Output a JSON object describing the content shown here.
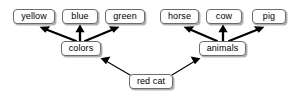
{
  "diagram": {
    "type": "graph",
    "title": "",
    "background_color": "#ffffff",
    "node_fill_color": "#ffffff",
    "node_border_color": "#6b6b6b",
    "node_text_color": "#000000",
    "edge_color": "#000000",
    "shadow_color": "#000000",
    "nodes": [
      {
        "id": "yellow",
        "label": "yellow",
        "x": 13,
        "y": 9,
        "w": 42,
        "h": 15
      },
      {
        "id": "blue",
        "label": "blue",
        "x": 62,
        "y": 9,
        "w": 36,
        "h": 15
      },
      {
        "id": "green",
        "label": "green",
        "x": 105,
        "y": 9,
        "w": 40,
        "h": 15
      },
      {
        "id": "horse",
        "label": "horse",
        "x": 160,
        "y": 9,
        "w": 39,
        "h": 15
      },
      {
        "id": "cow",
        "label": "cow",
        "x": 206,
        "y": 9,
        "w": 36,
        "h": 15
      },
      {
        "id": "pig",
        "label": "pig",
        "x": 252,
        "y": 9,
        "w": 34,
        "h": 15
      },
      {
        "id": "colors",
        "label": "colors",
        "x": 61,
        "y": 41,
        "w": 40,
        "h": 15
      },
      {
        "id": "animals",
        "label": "animals",
        "x": 199,
        "y": 41,
        "w": 47,
        "h": 15
      },
      {
        "id": "redcat",
        "label": "red cat",
        "x": 129,
        "y": 74,
        "w": 44,
        "h": 15
      }
    ],
    "edges": [
      {
        "from": "colors",
        "to": "yellow",
        "style": "thick",
        "arrow": "end"
      },
      {
        "from": "colors",
        "to": "blue",
        "style": "thick",
        "arrow": "end"
      },
      {
        "from": "colors",
        "to": "green",
        "style": "thick",
        "arrow": "end"
      },
      {
        "from": "animals",
        "to": "horse",
        "style": "thick",
        "arrow": "end"
      },
      {
        "from": "animals",
        "to": "cow",
        "style": "thick",
        "arrow": "end"
      },
      {
        "from": "animals",
        "to": "pig",
        "style": "thick",
        "arrow": "end"
      },
      {
        "from": "redcat",
        "to": "colors",
        "style": "thin",
        "arrow": "end"
      },
      {
        "from": "redcat",
        "to": "animals",
        "style": "thin",
        "arrow": "end"
      }
    ]
  }
}
